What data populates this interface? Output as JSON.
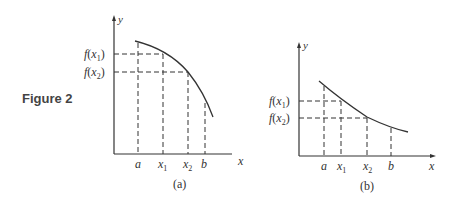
{
  "figure_label": "Figure 2",
  "panels": [
    {
      "id": "a",
      "caption": "(a)",
      "y_axis_label": "y",
      "x_axis_label": "x",
      "x_ticks": [
        "a",
        "x",
        "x",
        "b"
      ],
      "x_tick_subscripts": [
        "",
        "1",
        "2",
        ""
      ],
      "y_ticks": [
        "f(x",
        "f(x"
      ],
      "y_tick_subscripts": [
        "1",
        "2"
      ],
      "curve": "decreasing, concave down"
    },
    {
      "id": "b",
      "caption": "(b)",
      "y_axis_label": "y",
      "x_axis_label": "x",
      "x_ticks": [
        "a",
        "x",
        "x",
        "b"
      ],
      "x_tick_subscripts": [
        "",
        "1",
        "2",
        ""
      ],
      "y_ticks": [
        "f(x",
        "f(x"
      ],
      "y_tick_subscripts": [
        "1",
        "2"
      ],
      "curve": "decreasing, concave up"
    }
  ],
  "colors": {
    "ink": "#333333",
    "label": "#444444"
  }
}
